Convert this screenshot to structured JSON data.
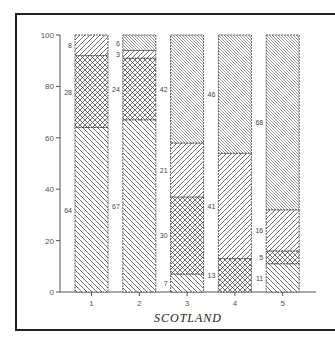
{
  "chart_data": {
    "type": "bar",
    "stacked": true,
    "title": "",
    "xlabel": "SCOTLAND",
    "ylabel": "",
    "ylim": [
      0,
      100
    ],
    "yticks": [
      0,
      20,
      40,
      60,
      80,
      100
    ],
    "categories": [
      "1",
      "2",
      "3",
      "4",
      "5"
    ],
    "series": [
      {
        "name": "segment-1 (backslash hatch)",
        "pattern": "backslash",
        "values": [
          64,
          67,
          7,
          0,
          11
        ]
      },
      {
        "name": "segment-2 (crosshatch)",
        "pattern": "crosshatch",
        "values": [
          28,
          24,
          30,
          13,
          5
        ]
      },
      {
        "name": "segment-3 (forward-slash hatch)",
        "pattern": "slash",
        "values": [
          8,
          3,
          21,
          41,
          16
        ]
      },
      {
        "name": "segment-4 (dense backslash hatch)",
        "pattern": "dense",
        "values": [
          0,
          6,
          42,
          46,
          68
        ]
      }
    ],
    "grid": false,
    "legend": "none"
  },
  "labels": {
    "xlabel": "SCOTLAND",
    "yticks": [
      "0",
      "20",
      "40",
      "60",
      "80",
      "100"
    ],
    "xticks": [
      "1",
      "2",
      "3",
      "4",
      "5"
    ]
  }
}
